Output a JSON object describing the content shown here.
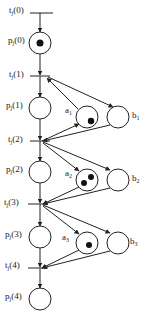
{
  "diagram": {
    "type": "petri-net",
    "transitions": [
      {
        "id": "t0",
        "label": "t",
        "sub": "j",
        "arg": "(0)",
        "y": 13
      },
      {
        "id": "t1",
        "label": "t",
        "sub": "j",
        "arg": "(1)",
        "y": 76
      },
      {
        "id": "t2",
        "label": "t",
        "sub": "j",
        "arg": "(2)",
        "y": 141
      },
      {
        "id": "t3",
        "label": "t",
        "sub": "j",
        "arg": "(3)",
        "y": 204
      },
      {
        "id": "t4",
        "label": "t",
        "sub": "j",
        "arg": "(4)",
        "y": 268
      }
    ],
    "places_main": [
      {
        "id": "p0",
        "label": "p",
        "sub": "j",
        "arg": "(0)",
        "y": 43,
        "tokens": 1
      },
      {
        "id": "p1",
        "label": "p",
        "sub": "j",
        "arg": "(1)",
        "y": 108,
        "tokens": 0
      },
      {
        "id": "p2",
        "label": "p",
        "sub": "j",
        "arg": "(2)",
        "y": 172,
        "tokens": 0
      },
      {
        "id": "p3",
        "label": "p",
        "sub": "j",
        "arg": "(3)",
        "y": 237,
        "tokens": 0
      },
      {
        "id": "p4",
        "label": "p",
        "sub": "j",
        "arg": "(4)",
        "y": 299,
        "tokens": 0
      }
    ],
    "places_a": [
      {
        "id": "a1",
        "label": "a",
        "sub": "1",
        "y": 117,
        "tokens": 1
      },
      {
        "id": "a2",
        "label": "a",
        "sub": "2",
        "y": 180,
        "tokens": 2
      },
      {
        "id": "a3",
        "label": "a",
        "sub": "3",
        "y": 243,
        "tokens": 1
      }
    ],
    "places_b": [
      {
        "id": "b1",
        "label": "b",
        "sub": "1",
        "y": 117,
        "tokens": 0
      },
      {
        "id": "b2",
        "label": "b",
        "sub": "2",
        "y": 180,
        "tokens": 0
      },
      {
        "id": "b3",
        "label": "b",
        "sub": "3",
        "y": 243,
        "tokens": 0
      }
    ]
  },
  "labels": {
    "t0": "t",
    "t0s": "j",
    "t0a": "(0)",
    "t1": "t",
    "t1s": "j",
    "t1a": "(1)",
    "t2": "t",
    "t2s": "j",
    "t2a": "(2)",
    "t3": "t",
    "t3s": "j",
    "t3a": "(3)",
    "t4": "t",
    "t4s": "j",
    "t4a": "(4)",
    "p0": "p",
    "p0s": "j",
    "p0a": "(0)",
    "p1": "p",
    "p1s": "j",
    "p1a": "(1)",
    "p2": "p",
    "p2s": "j",
    "p2a": "(2)",
    "p3": "p",
    "p3s": "j",
    "p3a": "(3)",
    "p4": "p",
    "p4s": "j",
    "p4a": "(4)",
    "a1": "a",
    "a1s": "1",
    "a2": "a",
    "a2s": "2",
    "a3": "a",
    "a3s": "3",
    "b1": "b",
    "b1s": "1",
    "b2": "b",
    "b2s": "2",
    "b3": "b",
    "b3s": "3"
  }
}
